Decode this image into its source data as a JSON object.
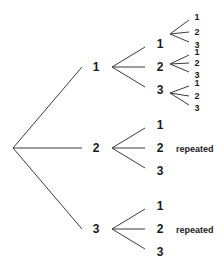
{
  "diagram": {
    "type": "tree",
    "root": {
      "x": 13,
      "y": 148
    },
    "level1": [
      {
        "label": "1",
        "x": 96,
        "y": 67,
        "vertex": {
          "x": 112,
          "y": 67
        },
        "children": [
          {
            "label": "1",
            "x": 160,
            "y": 44,
            "vertex": {
              "x": 170,
              "y": 34
            },
            "children": [
              {
                "label": "1",
                "x": 197,
                "y": 17
              },
              {
                "label": "2",
                "x": 197,
                "y": 32
              },
              {
                "label": "3",
                "x": 197,
                "y": 45
              }
            ]
          },
          {
            "label": "2",
            "x": 160,
            "y": 67,
            "vertex": {
              "x": 170,
              "y": 64
            },
            "children": [
              {
                "label": "1",
                "x": 197,
                "y": 52
              },
              {
                "label": "2",
                "x": 197,
                "y": 63
              },
              {
                "label": "3",
                "x": 197,
                "y": 75
              }
            ]
          },
          {
            "label": "3",
            "x": 160,
            "y": 90,
            "vertex": {
              "x": 170,
              "y": 93
            },
            "children": [
              {
                "label": "1",
                "x": 197,
                "y": 83
              },
              {
                "label": "2",
                "x": 197,
                "y": 96
              },
              {
                "label": "3",
                "x": 197,
                "y": 108
              }
            ]
          }
        ]
      },
      {
        "label": "2",
        "x": 96,
        "y": 148,
        "vertex": {
          "x": 112,
          "y": 148
        },
        "note": "repeated",
        "children": [
          {
            "label": "1",
            "x": 160,
            "y": 125
          },
          {
            "label": "2",
            "x": 160,
            "y": 148
          },
          {
            "label": "3",
            "x": 160,
            "y": 171
          }
        ]
      },
      {
        "label": "3",
        "x": 96,
        "y": 229,
        "vertex": {
          "x": 112,
          "y": 229
        },
        "note": "repeated",
        "children": [
          {
            "label": "1",
            "x": 160,
            "y": 206
          },
          {
            "label": "2",
            "x": 160,
            "y": 229
          },
          {
            "label": "3",
            "x": 160,
            "y": 252
          }
        ]
      }
    ]
  }
}
